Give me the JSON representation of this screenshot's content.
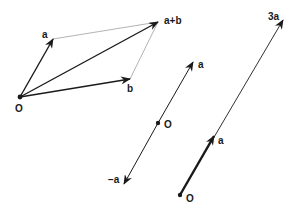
{
  "diagram": {
    "parallelogram": {
      "origin_label": "O",
      "vector_a_label": "a",
      "vector_b_label": "b",
      "sum_label": "a+b"
    },
    "negation": {
      "origin_label": "O",
      "vector_a_label": "a",
      "negative_label": "−a"
    },
    "scaling": {
      "origin_label": "O",
      "vector_a_label": "a",
      "scaled_label": "3a"
    },
    "colors": {
      "vector": "#1a1a1a",
      "guide": "#9a9a9a"
    }
  }
}
